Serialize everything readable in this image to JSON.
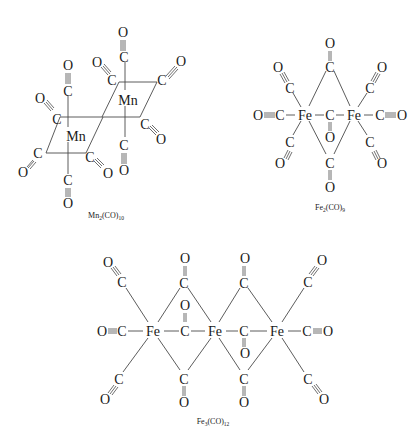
{
  "diagram": {
    "type": "chemical-structures",
    "background": "#ffffff",
    "line_color": "#4a4a4a",
    "text_color": "#1a1a1a",
    "molecules": [
      {
        "id": "mn2co10",
        "caption": "Mn2(CO)10",
        "caption_main": "Mn",
        "caption_sub1": "2",
        "caption_mid": "(CO)",
        "caption_sub2": "10",
        "metals": [
          {
            "symbol": "Mn",
            "x": 128,
            "y": 100
          },
          {
            "symbol": "Mn",
            "x": 76,
            "y": 135
          }
        ]
      },
      {
        "id": "fe2co9",
        "caption": "Fe2(CO)9",
        "caption_main": "Fe",
        "caption_sub1": "2",
        "caption_mid": "(CO)",
        "caption_sub2": "9",
        "metals": [
          {
            "symbol": "Fe",
            "x": 305,
            "y": 115
          },
          {
            "symbol": "Fe",
            "x": 354,
            "y": 115
          }
        ]
      },
      {
        "id": "fe3co12",
        "caption": "Fe3(CO)12",
        "caption_main": "Fe",
        "caption_sub1": "3",
        "caption_mid": "(CO)",
        "caption_sub2": "12",
        "metals": [
          {
            "symbol": "Fe",
            "x": 153,
            "y": 331
          },
          {
            "symbol": "Fe",
            "x": 215,
            "y": 331
          },
          {
            "symbol": "Fe",
            "x": 277,
            "y": 331
          }
        ]
      }
    ],
    "atoms": {
      "metal_mn": "Mn",
      "metal_fe": "Fe",
      "carbon": "C",
      "oxygen": "O"
    }
  }
}
